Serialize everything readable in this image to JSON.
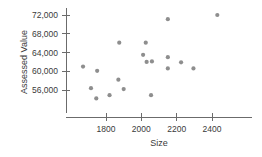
{
  "chart_data": {
    "type": "scatter",
    "title": "",
    "xlabel": "Size",
    "ylabel": "Assessed Value",
    "xlim": [
      1630,
      2560
    ],
    "ylim": [
      53000,
      73600
    ],
    "grid": false,
    "legend": "none",
    "xticks": [
      1800,
      2000,
      2200,
      2400
    ],
    "xtick_labels": [
      "1800",
      "2000",
      "2200",
      "2400"
    ],
    "yticks": [
      56000,
      60000,
      64000,
      68000,
      72000
    ],
    "ytick_labels": [
      "56,000",
      "60,000",
      "64,000",
      "68,000",
      "72,000"
    ],
    "marker_color": "#8e8e8e",
    "axis_color": "#6b6b6b",
    "points": [
      {
        "x": 1670,
        "y": 61000
      },
      {
        "x": 1750,
        "y": 60100
      },
      {
        "x": 1715,
        "y": 56400
      },
      {
        "x": 1745,
        "y": 54200
      },
      {
        "x": 1820,
        "y": 54900
      },
      {
        "x": 1875,
        "y": 66100
      },
      {
        "x": 1870,
        "y": 58200
      },
      {
        "x": 1900,
        "y": 56200
      },
      {
        "x": 2025,
        "y": 66100
      },
      {
        "x": 2010,
        "y": 63500
      },
      {
        "x": 2060,
        "y": 62100
      },
      {
        "x": 2030,
        "y": 62000
      },
      {
        "x": 2055,
        "y": 54900
      },
      {
        "x": 2150,
        "y": 71100
      },
      {
        "x": 2150,
        "y": 63000
      },
      {
        "x": 2225,
        "y": 61900
      },
      {
        "x": 2150,
        "y": 60600
      },
      {
        "x": 2430,
        "y": 72000
      },
      {
        "x": 2295,
        "y": 60600
      }
    ]
  }
}
